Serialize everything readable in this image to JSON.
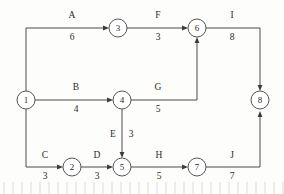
{
  "diagram": {
    "type": "activity-on-arrow-network",
    "title": "",
    "nodes": [
      {
        "id": "1",
        "label": "1",
        "cx": 26,
        "cy": 100
      },
      {
        "id": "2",
        "label": "2",
        "cx": 72,
        "cy": 167
      },
      {
        "id": "3",
        "label": "3",
        "cx": 118,
        "cy": 28
      },
      {
        "id": "4",
        "label": "4",
        "cx": 122,
        "cy": 100
      },
      {
        "id": "5",
        "label": "5",
        "cx": 122,
        "cy": 167
      },
      {
        "id": "6",
        "label": "6",
        "cx": 197,
        "cy": 28
      },
      {
        "id": "7",
        "label": "7",
        "cx": 197,
        "cy": 167
      },
      {
        "id": "8",
        "label": "8",
        "cx": 260,
        "cy": 100
      }
    ],
    "node_radius": 9,
    "edges": [
      {
        "id": "A",
        "name": "A",
        "weight": "6",
        "from": "1",
        "to": "3",
        "name_x": 72,
        "name_y": 18,
        "weight_x": 72,
        "weight_y": 40
      },
      {
        "id": "B",
        "name": "B",
        "weight": "4",
        "from": "1",
        "to": "4",
        "name_x": 76,
        "name_y": 90,
        "weight_x": 76,
        "weight_y": 112
      },
      {
        "id": "C",
        "name": "C",
        "weight": "3",
        "from": "1",
        "to": "2",
        "name_x": 45,
        "name_y": 158,
        "weight_x": 45,
        "weight_y": 179
      },
      {
        "id": "D",
        "name": "D",
        "weight": "3",
        "from": "2",
        "to": "5",
        "name_x": 97,
        "name_y": 158,
        "weight_x": 97,
        "weight_y": 179
      },
      {
        "id": "E",
        "name": "E",
        "weight": "3",
        "from": "4",
        "to": "5",
        "name_x": 113,
        "name_y": 137,
        "weight_x": 131,
        "weight_y": 137
      },
      {
        "id": "F",
        "name": "F",
        "weight": "3",
        "from": "3",
        "to": "6",
        "name_x": 158,
        "name_y": 18,
        "weight_x": 158,
        "weight_y": 40
      },
      {
        "id": "G",
        "name": "G",
        "weight": "5",
        "from": "4",
        "to": "6",
        "name_x": 158,
        "name_y": 90,
        "weight_x": 158,
        "weight_y": 112
      },
      {
        "id": "H",
        "name": "H",
        "weight": "5",
        "from": "5",
        "to": "7",
        "name_x": 159,
        "name_y": 158,
        "weight_x": 159,
        "weight_y": 179
      },
      {
        "id": "I",
        "name": "I",
        "weight": "8",
        "from": "6",
        "to": "8",
        "name_x": 232,
        "name_y": 18,
        "weight_x": 232,
        "weight_y": 40
      },
      {
        "id": "J",
        "name": "J",
        "weight": "7",
        "from": "7",
        "to": "8",
        "name_x": 232,
        "name_y": 158,
        "weight_x": 232,
        "weight_y": 179
      }
    ],
    "colors": {
      "line": "#4a4a4a",
      "node_stroke": "#555555",
      "node_fill": "#ffffff",
      "text": "#2b2b2b",
      "background": "#fdfdfb"
    }
  }
}
